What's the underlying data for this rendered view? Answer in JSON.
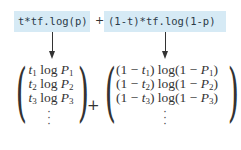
{
  "expression": {
    "term1_code": "t*tf.log(p)",
    "plus": "+",
    "term2_code": "(1-t)*tf.log(1-p)"
  },
  "left_vector": {
    "rows": [
      {
        "t": "t",
        "sub": "1",
        "log": "log",
        "P": "P",
        "psub": "1"
      },
      {
        "t": "t",
        "sub": "2",
        "log": "log",
        "P": "P",
        "psub": "2"
      },
      {
        "t": "t",
        "sub": "3",
        "log": "log",
        "P": "P",
        "psub": "3"
      }
    ],
    "ellipsis": "⋮"
  },
  "vector_plus": "+",
  "right_vector": {
    "rows": [
      {
        "pre": "(1 − ",
        "t": "t",
        "sub": "1",
        "mid": ") log(1 − ",
        "P": "P",
        "psub": "1",
        "post": ")"
      },
      {
        "pre": "(1 − ",
        "t": "t",
        "sub": "2",
        "mid": ") log(1 − ",
        "P": "P",
        "psub": "2",
        "post": ")"
      },
      {
        "pre": "(1 − ",
        "t": "t",
        "sub": "3",
        "mid": ") log(1 − ",
        "P": "P",
        "psub": "3",
        "post": ")"
      }
    ],
    "ellipsis": "⋮"
  },
  "colors": {
    "code_bg": "#d6eaf5",
    "code_text": "#2b3a48",
    "ink": "#333333"
  }
}
